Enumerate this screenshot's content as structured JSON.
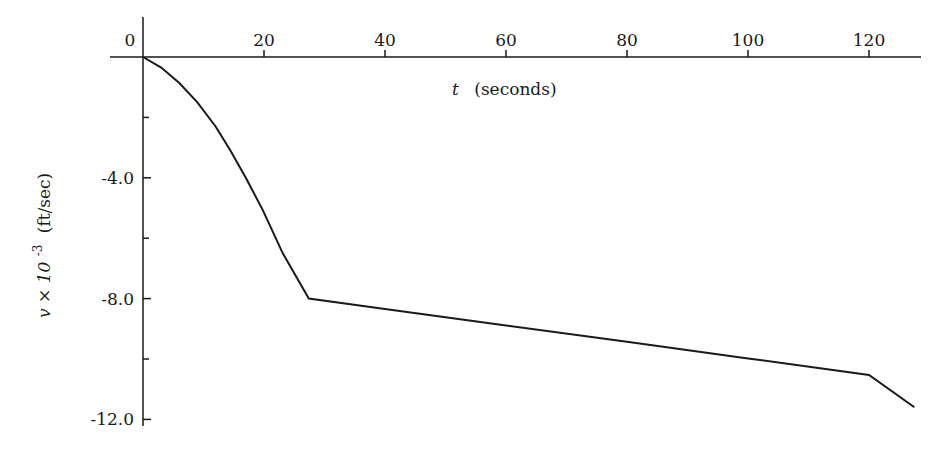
{
  "chart_data": {
    "type": "line",
    "title": "",
    "xlabel": "t (seconds)",
    "xlabel_var": "t",
    "xlabel_unit": "(seconds)",
    "ylabel": "v × 10^-3 (ft/sec)",
    "ylabel_var": "v × 10",
    "ylabel_exp": "-3",
    "ylabel_unit": "(ft/sec)",
    "xlim": [
      0,
      129
    ],
    "ylim": [
      -12.0,
      0
    ],
    "x_ticks": [
      0,
      20,
      40,
      60,
      80,
      100,
      120
    ],
    "x_tick_labels": [
      "0",
      "20",
      "40",
      "60",
      "80",
      "100",
      "120"
    ],
    "y_ticks": [
      -4.0,
      -8.0,
      -12.0
    ],
    "y_tick_labels": [
      "-4.0",
      "-8.0",
      "-12.0"
    ],
    "y_minor_ticks": [
      -2.0,
      -6.0,
      -10.0
    ],
    "grid": false,
    "legend": null,
    "series": [
      {
        "name": "v(t)",
        "x": [
          0,
          3,
          6,
          9,
          12,
          14.4,
          17,
          19.8,
          23.1,
          27.4,
          40,
          60,
          80,
          100,
          120,
          127.5
        ],
        "values": [
          0,
          -0.35,
          -0.86,
          -1.5,
          -2.3,
          -3.08,
          -4.0,
          -5.07,
          -6.5,
          -8.0,
          -8.34,
          -8.89,
          -9.43,
          -9.98,
          -10.53,
          -11.6
        ]
      }
    ],
    "annotations": []
  }
}
